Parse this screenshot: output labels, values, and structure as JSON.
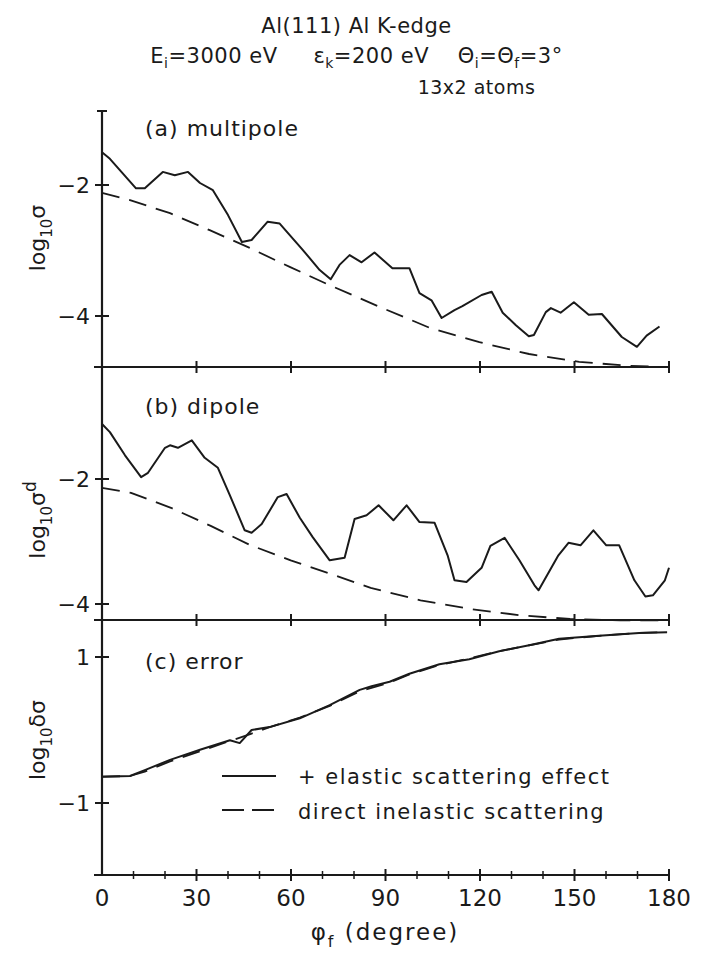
{
  "header": {
    "line1": "Al(111)  Al K-edge",
    "line2_parts": {
      "ei": "E",
      "ei_sub": "i",
      "ei_val": "=3000 eV",
      "ek": "ε",
      "ek_sub": "k",
      "ek_val": "=200 eV",
      "th": "Θ",
      "th_sub1": "i",
      "th_mid": "=Θ",
      "th_sub2": "f",
      "th_val": "=3°"
    },
    "line3": "13x2 atoms"
  },
  "xaxis": {
    "label_main": "φ",
    "label_sub": "f",
    "label_rest": " (degree)",
    "ticks": [
      0,
      30,
      60,
      90,
      120,
      150,
      180
    ]
  },
  "legend": {
    "solid": "+ elastic scattering effect",
    "dashed": "direct inelastic scattering"
  },
  "chart_data": [
    {
      "type": "line",
      "panel": "a",
      "title": "(a) multipole",
      "ylabel": "log10 σ",
      "xlim": [
        0,
        180
      ],
      "ylim": [
        -4.8,
        -0.9
      ],
      "yticks": [
        -2,
        -4
      ],
      "series": [
        {
          "name": "+ elastic scattering effect",
          "style": "solid",
          "x": [
            0,
            2.5,
            10.8,
            13.6,
            19.3,
            23.1,
            27.3,
            31.1,
            35.2,
            40.0,
            44.4,
            47.5,
            52.6,
            56.4,
            63.7,
            69.1,
            72.6,
            75.4,
            78.6,
            82.4,
            86.5,
            92.2,
            97.6,
            100.8,
            104.6,
            107.8,
            111.9,
            114.4,
            120.5,
            123.7,
            127.2,
            131.4,
            135.5,
            137.1,
            140.9,
            142.5,
            145.6,
            149.8,
            154.5,
            158.7,
            165.0,
            169.8,
            172.9,
            177.0
          ],
          "y": [
            -1.5,
            -1.6,
            -2.05,
            -2.05,
            -1.8,
            -1.85,
            -1.8,
            -1.97,
            -2.08,
            -2.46,
            -2.87,
            -2.84,
            -2.56,
            -2.59,
            -2.99,
            -3.3,
            -3.44,
            -3.22,
            -3.07,
            -3.18,
            -3.03,
            -3.27,
            -3.27,
            -3.65,
            -3.76,
            -4.03,
            -3.91,
            -3.85,
            -3.68,
            -3.63,
            -3.95,
            -4.14,
            -4.31,
            -4.29,
            -3.94,
            -3.88,
            -3.95,
            -3.79,
            -3.98,
            -3.97,
            -4.32,
            -4.47,
            -4.3,
            -4.16
          ]
        },
        {
          "name": "direct inelastic scattering",
          "style": "dashed",
          "x": [
            0,
            8.9,
            21.6,
            34.2,
            46.9,
            59.6,
            72.3,
            88.1,
            104.0,
            119.8,
            135.6,
            151.5,
            167.3,
            179.4
          ],
          "y": [
            -2.12,
            -2.23,
            -2.43,
            -2.69,
            -2.96,
            -3.25,
            -3.53,
            -3.86,
            -4.18,
            -4.4,
            -4.58,
            -4.7,
            -4.76,
            -4.78
          ]
        }
      ]
    },
    {
      "type": "line",
      "panel": "b",
      "title": "(b) dipole",
      "ylabel": "log10 σd",
      "xlim": [
        0,
        180
      ],
      "ylim": [
        -4.25,
        -0.4
      ],
      "yticks": [
        -2,
        -4
      ],
      "series": [
        {
          "name": "+ elastic scattering effect",
          "style": "solid",
          "x": [
            0,
            2.5,
            7.3,
            12.4,
            14.6,
            20.0,
            21.6,
            24.1,
            28.5,
            32.6,
            36.8,
            40.6,
            45.3,
            47.5,
            50.7,
            55.8,
            58.6,
            62.8,
            66.9,
            72.3,
            77.0,
            80.2,
            84.0,
            87.8,
            92.5,
            96.7,
            100.8,
            105.6,
            109.7,
            111.9,
            115.7,
            120.5,
            123.3,
            127.8,
            132.5,
            137.3,
            138.6,
            144.9,
            148.1,
            151.9,
            156.0,
            160.1,
            164.2,
            169.0,
            172.5,
            174.9,
            178.7,
            182.5
          ],
          "y": [
            -1.12,
            -1.25,
            -1.62,
            -1.97,
            -1.9,
            -1.5,
            -1.46,
            -1.5,
            -1.38,
            -1.66,
            -1.82,
            -2.26,
            -2.82,
            -2.86,
            -2.72,
            -2.29,
            -2.24,
            -2.62,
            -2.93,
            -3.3,
            -3.26,
            -2.64,
            -2.58,
            -2.42,
            -2.66,
            -2.42,
            -2.69,
            -2.7,
            -3.22,
            -3.62,
            -3.65,
            -3.42,
            -3.07,
            -2.94,
            -3.3,
            -3.7,
            -3.78,
            -3.22,
            -3.02,
            -3.06,
            -2.82,
            -3.06,
            -3.06,
            -3.62,
            -3.88,
            -3.86,
            -3.62,
            -3.42
          ]
        },
        {
          "name": "direct inelastic scattering",
          "style": "dashed",
          "x": [
            0,
            9.2,
            21.9,
            34.5,
            47.2,
            59.9,
            72.6,
            85.3,
            101.1,
            116.9,
            132.8,
            148.6,
            164.5,
            179.4
          ],
          "y": [
            -2.14,
            -2.22,
            -2.46,
            -2.75,
            -3.06,
            -3.3,
            -3.52,
            -3.74,
            -3.94,
            -4.08,
            -4.18,
            -4.24,
            -4.26,
            -4.26
          ]
        }
      ]
    },
    {
      "type": "line",
      "panel": "c",
      "title": "(c) error",
      "ylabel": "log10 δσ",
      "xlim": [
        0,
        180
      ],
      "ylim": [
        -1.98,
        1.5
      ],
      "yticks": [
        1,
        -1
      ],
      "series": [
        {
          "name": "+ elastic scattering effect",
          "style": "solid",
          "x": [
            0,
            8.9,
            13.6,
            21.6,
            31.1,
            40.6,
            43.7,
            47.5,
            53.2,
            62.8,
            72.3,
            81.8,
            85.6,
            91.3,
            97.6,
            107.1,
            116.6,
            126.1,
            135.6,
            145.1,
            157.8,
            170.5,
            179.4
          ],
          "y": [
            -0.64,
            -0.63,
            -0.55,
            -0.41,
            -0.27,
            -0.14,
            -0.18,
            0.0,
            0.04,
            0.16,
            0.34,
            0.55,
            0.6,
            0.66,
            0.77,
            0.9,
            0.97,
            1.08,
            1.16,
            1.25,
            1.29,
            1.33,
            1.34
          ]
        },
        {
          "name": "direct inelastic scattering",
          "style": "dashed",
          "x": [
            0,
            8.9,
            13.6,
            21.6,
            31.1,
            40.6,
            47.5,
            53.2,
            62.8,
            72.3,
            81.8,
            91.3,
            97.6,
            107.1,
            116.6,
            126.1,
            135.6,
            145.1,
            157.8,
            170.5,
            179.4
          ],
          "y": [
            -0.64,
            -0.63,
            -0.57,
            -0.43,
            -0.29,
            -0.15,
            -0.05,
            0.04,
            0.17,
            0.33,
            0.53,
            0.65,
            0.76,
            0.89,
            0.98,
            1.08,
            1.16,
            1.24,
            1.29,
            1.33,
            1.34
          ]
        }
      ]
    }
  ]
}
